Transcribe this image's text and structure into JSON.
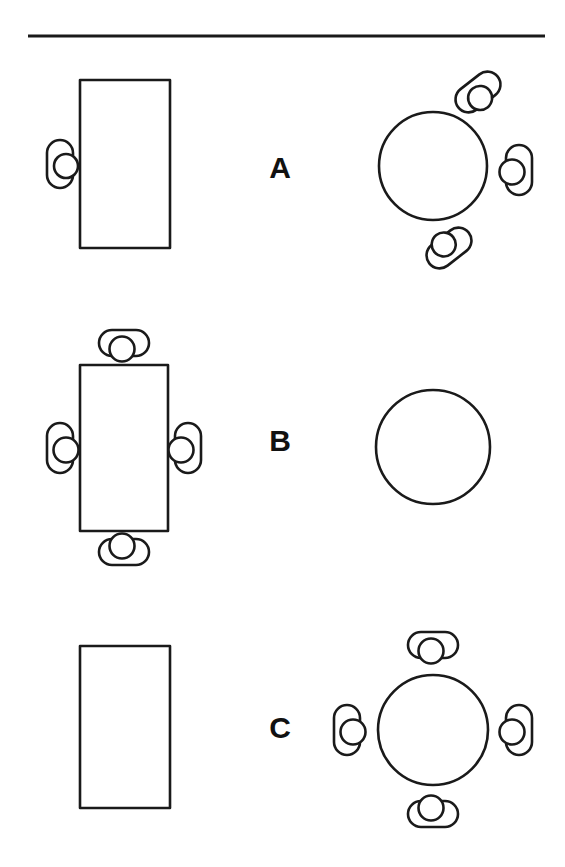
{
  "figure": {
    "background_color": "#ffffff",
    "stroke_color": "#1a1a1a",
    "divider": {
      "name": "top-horizontal-rule",
      "x1": 28,
      "y1": 36,
      "x2": 545,
      "y2": 36
    },
    "rows": [
      {
        "label": "A",
        "label_x": 280,
        "label_y": 167,
        "rect_table": {
          "x": 80,
          "y": 80,
          "width": 90,
          "height": 168,
          "occupied": true,
          "seats": [
            {
              "position": "left",
              "cx": 60,
              "cy": 164,
              "angle": 0,
              "head_side": "right"
            }
          ]
        },
        "round_table": {
          "cx": 433,
          "cy": 166,
          "r": 54,
          "occupied": true,
          "seats": [
            {
              "position": "upper-right-diagonal",
              "cx": 478,
              "cy": 92,
              "angle": -38,
              "head_side": "toward-table"
            },
            {
              "position": "right",
              "cx": 519,
              "cy": 170,
              "angle": 0,
              "head_side": "toward-table"
            },
            {
              "position": "lower-left-diagonal",
              "cx": 449,
              "cy": 248,
              "angle": 38,
              "head_side": "toward-table"
            }
          ]
        }
      },
      {
        "label": "B",
        "label_x": 280,
        "label_y": 440,
        "rect_table": {
          "x": 80,
          "y": 365,
          "width": 88,
          "height": 166,
          "occupied": true,
          "seats": [
            {
              "position": "top",
              "cx": 124,
              "cy": 343,
              "angle": 90,
              "head_side": "toward-table"
            },
            {
              "position": "bottom",
              "cx": 124,
              "cy": 552,
              "angle": 90,
              "head_side": "toward-table"
            },
            {
              "position": "left",
              "cx": 60,
              "cy": 448,
              "angle": 0,
              "head_side": "toward-table"
            },
            {
              "position": "right",
              "cx": 188,
              "cy": 448,
              "angle": 0,
              "head_side": "toward-table"
            }
          ]
        },
        "round_table": {
          "cx": 433,
          "cy": 447,
          "r": 57,
          "occupied": false,
          "seats": []
        }
      },
      {
        "label": "C",
        "label_x": 280,
        "label_y": 727,
        "rect_table": {
          "x": 80,
          "y": 646,
          "width": 90,
          "height": 162,
          "occupied": false,
          "seats": []
        },
        "round_table": {
          "cx": 433,
          "cy": 730,
          "r": 55,
          "occupied": true,
          "seats": [
            {
              "position": "top",
              "cx": 433,
              "cy": 645,
              "angle": 90,
              "head_side": "toward-table"
            },
            {
              "position": "bottom",
              "cx": 433,
              "cy": 814,
              "angle": 90,
              "head_side": "toward-table"
            },
            {
              "position": "left",
              "cx": 347,
              "cy": 730,
              "angle": 0,
              "head_side": "toward-table"
            },
            {
              "position": "right",
              "cx": 519,
              "cy": 730,
              "angle": 0,
              "head_side": "toward-table"
            }
          ]
        }
      }
    ],
    "legend_notes": {
      "rect_table_name": "rectangular-table",
      "round_table_name": "round-table",
      "seat_name": "seated-person"
    }
  }
}
